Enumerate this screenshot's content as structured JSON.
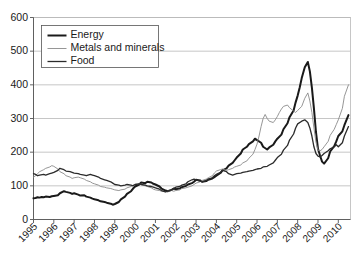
{
  "chart_data": {
    "type": "line",
    "title": "",
    "subtitle": "",
    "xlabel": "",
    "ylabel": "",
    "xlim": [
      1995,
      2010.6
    ],
    "ylim": [
      0,
      600
    ],
    "grid": true,
    "grid_axis": "y",
    "legend_position": "top-left",
    "y_ticks": [
      0,
      100,
      200,
      300,
      400,
      500,
      600
    ],
    "y_tick_labels": [
      "0",
      "100",
      "200",
      "300",
      "400",
      "500",
      "600"
    ],
    "x_ticks": [
      1995,
      1996,
      1997,
      1998,
      1999,
      2000,
      2001,
      2002,
      2003,
      2004,
      2005,
      2006,
      2007,
      2008,
      2009,
      2010
    ],
    "x_tick_labels": [
      "1995",
      "1996",
      "1997",
      "1998",
      "1999",
      "2000",
      "2001",
      "2002",
      "2003",
      "2004",
      "2005",
      "2006",
      "2007",
      "2008",
      "2009",
      "2010"
    ],
    "legend": [
      {
        "name": "Energy",
        "color": "#1a1a1a",
        "width": 2.0
      },
      {
        "name": "Metals and minerals",
        "color": "#8a8a8a",
        "width": 0.9
      },
      {
        "name": "Food",
        "color": "#2b2b2b",
        "width": 1.3
      }
    ],
    "series": [
      {
        "name": "Energy",
        "color": "#1a1a1a",
        "width": 2.0,
        "x": [
          1995.0,
          1995.1,
          1995.2,
          1995.3,
          1995.4,
          1995.5,
          1995.6,
          1995.8,
          1995.9,
          1996.0,
          1996.2,
          1996.3,
          1996.5,
          1996.6,
          1996.8,
          1996.9,
          1997.0,
          1997.2,
          1997.3,
          1997.5,
          1997.6,
          1997.8,
          1997.9,
          1998.0,
          1998.2,
          1998.3,
          1998.5,
          1998.6,
          1998.8,
          1998.9,
          1999.0,
          1999.2,
          1999.3,
          1999.5,
          1999.6,
          1999.8,
          1999.9,
          2000.0,
          2000.2,
          2000.3,
          2000.5,
          2000.6,
          2000.8,
          2000.9,
          2001.0,
          2001.2,
          2001.3,
          2001.5,
          2001.6,
          2001.8,
          2001.9,
          2002.0,
          2002.2,
          2002.3,
          2002.5,
          2002.6,
          2002.8,
          2002.9,
          2003.0,
          2003.2,
          2003.3,
          2003.5,
          2003.6,
          2003.8,
          2003.9,
          2004.0,
          2004.2,
          2004.3,
          2004.5,
          2004.6,
          2004.8,
          2004.9,
          2005.0,
          2005.2,
          2005.3,
          2005.5,
          2005.6,
          2005.8,
          2005.9,
          2006.0,
          2006.2,
          2006.3,
          2006.5,
          2006.6,
          2006.8,
          2006.9,
          2007.0,
          2007.2,
          2007.3,
          2007.5,
          2007.6,
          2007.8,
          2007.9,
          2008.0,
          2008.1,
          2008.2,
          2008.35,
          2008.5,
          2008.6,
          2008.7,
          2008.8,
          2008.9,
          2009.0,
          2009.1,
          2009.2,
          2009.3,
          2009.5,
          2009.6,
          2009.8,
          2009.9,
          2010.0,
          2010.2,
          2010.3,
          2010.5
        ],
        "y": [
          63,
          64,
          66,
          65,
          67,
          66,
          68,
          67,
          69,
          70,
          72,
          78,
          84,
          82,
          79,
          76,
          78,
          74,
          71,
          72,
          68,
          65,
          62,
          60,
          57,
          54,
          52,
          50,
          47,
          44,
          46,
          52,
          60,
          68,
          76,
          84,
          92,
          98,
          104,
          110,
          108,
          112,
          110,
          106,
          104,
          98,
          92,
          86,
          84,
          88,
          92,
          90,
          92,
          96,
          100,
          104,
          108,
          112,
          118,
          116,
          112,
          114,
          118,
          122,
          126,
          130,
          138,
          146,
          152,
          160,
          168,
          176,
          184,
          196,
          208,
          216,
          224,
          232,
          240,
          236,
          228,
          216,
          208,
          214,
          222,
          232,
          240,
          252,
          268,
          286,
          304,
          324,
          348,
          368,
          392,
          420,
          452,
          468,
          440,
          392,
          330,
          260,
          210,
          190,
          172,
          166,
          182,
          202,
          218,
          232,
          248,
          262,
          280,
          310
        ]
      },
      {
        "name": "Metals and minerals",
        "color": "#8a8a8a",
        "width": 0.9,
        "x": [
          1995.0,
          1995.1,
          1995.2,
          1995.3,
          1995.5,
          1995.6,
          1995.8,
          1995.9,
          1996.0,
          1996.2,
          1996.3,
          1996.5,
          1996.6,
          1996.8,
          1996.9,
          1997.0,
          1997.2,
          1997.3,
          1997.5,
          1997.6,
          1997.8,
          1997.9,
          1998.0,
          1998.2,
          1998.3,
          1998.5,
          1998.6,
          1998.8,
          1998.9,
          1999.0,
          1999.2,
          1999.3,
          1999.5,
          1999.6,
          1999.8,
          1999.9,
          2000.0,
          2000.2,
          2000.3,
          2000.5,
          2000.6,
          2000.8,
          2000.9,
          2001.0,
          2001.2,
          2001.3,
          2001.5,
          2001.6,
          2001.8,
          2001.9,
          2002.0,
          2002.2,
          2002.3,
          2002.5,
          2002.6,
          2002.8,
          2002.9,
          2003.0,
          2003.2,
          2003.3,
          2003.5,
          2003.6,
          2003.8,
          2003.9,
          2004.0,
          2004.2,
          2004.3,
          2004.5,
          2004.6,
          2004.8,
          2004.9,
          2005.0,
          2005.2,
          2005.3,
          2005.5,
          2005.6,
          2005.8,
          2005.9,
          2006.0,
          2006.1,
          2006.2,
          2006.3,
          2006.4,
          2006.5,
          2006.6,
          2006.8,
          2006.9,
          2007.0,
          2007.1,
          2007.2,
          2007.3,
          2007.5,
          2007.6,
          2007.8,
          2007.9,
          2008.0,
          2008.2,
          2008.35,
          2008.5,
          2008.6,
          2008.7,
          2008.8,
          2008.9,
          2009.0,
          2009.1,
          2009.2,
          2009.3,
          2009.5,
          2009.6,
          2009.8,
          2009.9,
          2010.0,
          2010.2,
          2010.3,
          2010.5
        ],
        "y": [
          126,
          130,
          136,
          142,
          148,
          152,
          156,
          160,
          158,
          150,
          142,
          136,
          130,
          126,
          122,
          124,
          126,
          124,
          120,
          116,
          112,
          108,
          106,
          102,
          98,
          96,
          94,
          92,
          90,
          88,
          86,
          88,
          90,
          94,
          98,
          102,
          104,
          106,
          104,
          100,
          98,
          94,
          90,
          88,
          86,
          84,
          82,
          84,
          86,
          84,
          86,
          88,
          92,
          94,
          96,
          100,
          104,
          108,
          112,
          116,
          120,
          124,
          130,
          138,
          144,
          148,
          150,
          146,
          148,
          152,
          156,
          158,
          162,
          168,
          174,
          182,
          194,
          208,
          224,
          248,
          276,
          300,
          312,
          300,
          292,
          288,
          296,
          306,
          318,
          328,
          336,
          340,
          332,
          322,
          318,
          324,
          336,
          360,
          376,
          352,
          318,
          272,
          230,
          206,
          204,
          208,
          216,
          232,
          250,
          268,
          282,
          296,
          330,
          366,
          400
        ]
      },
      {
        "name": "Food",
        "color": "#2b2b2b",
        "width": 1.3,
        "x": [
          1995.0,
          1995.1,
          1995.2,
          1995.3,
          1995.5,
          1995.6,
          1995.8,
          1995.9,
          1996.0,
          1996.2,
          1996.3,
          1996.5,
          1996.6,
          1996.8,
          1996.9,
          1997.0,
          1997.2,
          1997.3,
          1997.5,
          1997.6,
          1997.8,
          1997.9,
          1998.0,
          1998.2,
          1998.3,
          1998.5,
          1998.6,
          1998.8,
          1998.9,
          1999.0,
          1999.2,
          1999.3,
          1999.5,
          1999.6,
          1999.8,
          1999.9,
          2000.0,
          2000.2,
          2000.3,
          2000.5,
          2000.6,
          2000.8,
          2000.9,
          2001.0,
          2001.2,
          2001.3,
          2001.5,
          2001.6,
          2001.8,
          2001.9,
          2002.0,
          2002.2,
          2002.3,
          2002.5,
          2002.6,
          2002.8,
          2002.9,
          2003.0,
          2003.2,
          2003.3,
          2003.5,
          2003.6,
          2003.8,
          2003.9,
          2004.0,
          2004.2,
          2004.3,
          2004.5,
          2004.6,
          2004.8,
          2004.9,
          2005.0,
          2005.2,
          2005.3,
          2005.5,
          2005.6,
          2005.8,
          2005.9,
          2006.0,
          2006.2,
          2006.3,
          2006.5,
          2006.6,
          2006.8,
          2006.9,
          2007.0,
          2007.2,
          2007.3,
          2007.5,
          2007.6,
          2007.8,
          2007.9,
          2008.0,
          2008.2,
          2008.35,
          2008.5,
          2008.6,
          2008.7,
          2008.8,
          2008.9,
          2009.0,
          2009.1,
          2009.2,
          2009.3,
          2009.5,
          2009.6,
          2009.8,
          2009.9,
          2010.0,
          2010.2,
          2010.3,
          2010.5
        ],
        "y": [
          136,
          134,
          130,
          132,
          134,
          132,
          136,
          138,
          140,
          146,
          152,
          148,
          144,
          142,
          140,
          138,
          136,
          134,
          132,
          130,
          134,
          132,
          130,
          126,
          122,
          118,
          116,
          112,
          108,
          104,
          102,
          100,
          102,
          104,
          102,
          100,
          104,
          106,
          104,
          102,
          100,
          98,
          96,
          94,
          90,
          86,
          82,
          84,
          88,
          92,
          96,
          98,
          102,
          106,
          112,
          118,
          120,
          118,
          114,
          112,
          116,
          120,
          124,
          130,
          134,
          140,
          146,
          142,
          136,
          132,
          134,
          136,
          138,
          140,
          142,
          144,
          146,
          148,
          150,
          152,
          156,
          158,
          162,
          168,
          176,
          184,
          194,
          206,
          220,
          236,
          254,
          272,
          284,
          292,
          296,
          288,
          272,
          248,
          216,
          196,
          188,
          186,
          190,
          196,
          204,
          210,
          216,
          222,
          216,
          228,
          248,
          276
        ]
      }
    ]
  }
}
